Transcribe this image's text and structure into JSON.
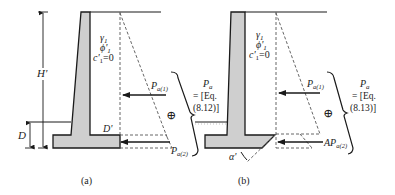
{
  "figure": {
    "colors": {
      "line": "#1a1a1a",
      "wall_fill": "#cfcfcf",
      "dashed": "#555555",
      "background": "#ffffff"
    },
    "panels": [
      {
        "id": "a",
        "caption": "(a)",
        "soil": {
          "gamma": "γ",
          "gamma_sub": "1",
          "phi": "ϕ'",
          "phi_sub": "1",
          "c": "c'",
          "c_sub": "1",
          "c_value": "=0"
        },
        "dimensions": {
          "height_label": "H'",
          "depth_label": "D",
          "d_prime_label": "D'"
        },
        "forces": [
          {
            "symbol": "P",
            "subscript": "a(1)"
          },
          {
            "symbol": "P",
            "subscript": "a(2)"
          }
        ],
        "sum_symbol": "⊕",
        "result": {
          "symbol": "P",
          "subscript": "a",
          "line1": "= [Eq.",
          "line2": "(8.12)]"
        }
      },
      {
        "id": "b",
        "caption": "(b)",
        "soil": {
          "gamma": "γ",
          "gamma_sub": "1",
          "phi": "ϕ'",
          "phi_sub": "1",
          "c": "c'",
          "c_sub": "1",
          "c_value": "=0"
        },
        "dimensions": {
          "angle_label": "α'"
        },
        "forces": [
          {
            "symbol": "P",
            "subscript": "a(1)"
          },
          {
            "symbol": "AP",
            "subscript": "a(2)"
          }
        ],
        "sum_symbol": "⊕",
        "result": {
          "symbol": "P",
          "subscript": "a",
          "line1": "= [Eq.",
          "line2": "(8.13)]"
        }
      }
    ]
  }
}
